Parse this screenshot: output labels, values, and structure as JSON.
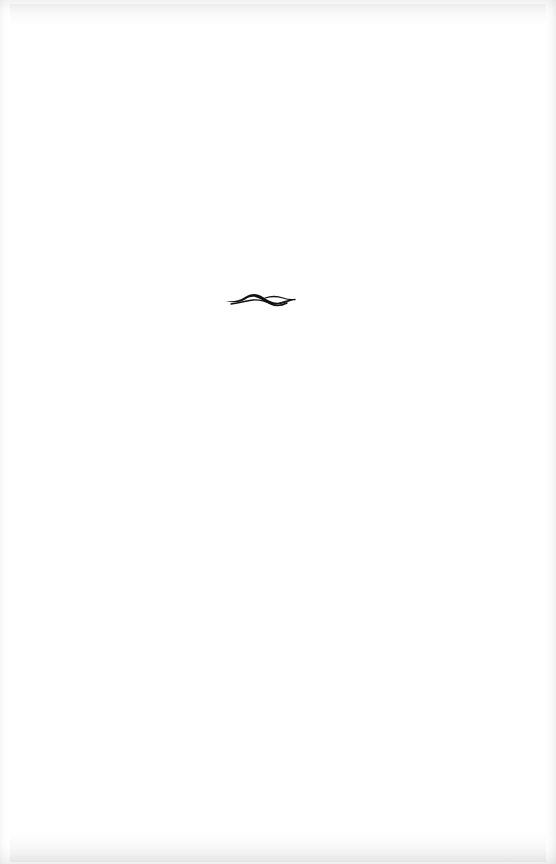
{
  "page": {
    "type": "blank book page",
    "background_color": "#ffffff"
  },
  "ornament": {
    "icon": "wave-flourish-icon",
    "color": "#111111"
  }
}
